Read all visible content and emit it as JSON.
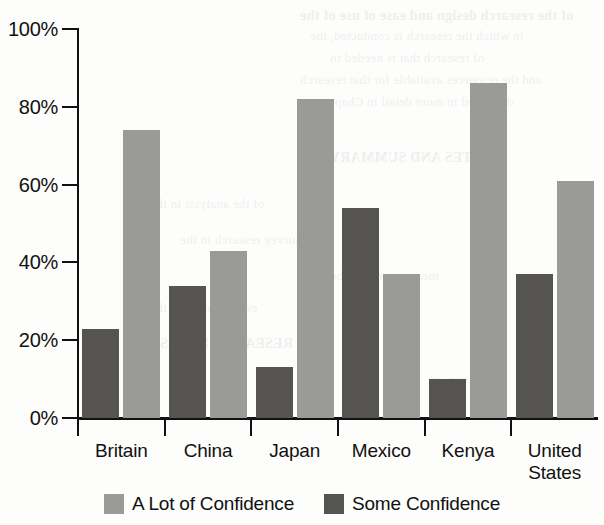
{
  "chart_data": {
    "type": "bar",
    "title": "",
    "xlabel": "",
    "ylabel": "",
    "ylim": [
      0,
      100
    ],
    "ytick_labels": [
      "0%",
      "20%",
      "40%",
      "60%",
      "80%",
      "100%"
    ],
    "ytick_values": [
      0,
      20,
      40,
      60,
      80,
      100
    ],
    "grid": false,
    "legend_position": "bottom-center",
    "categories": [
      "Britain",
      "China",
      "Japan",
      "Mexico",
      "Kenya",
      "United States"
    ],
    "category_label_lines": [
      [
        "Britain"
      ],
      [
        "China"
      ],
      [
        "Japan"
      ],
      [
        "Mexico"
      ],
      [
        "Kenya"
      ],
      [
        "United",
        "States"
      ]
    ],
    "series": [
      {
        "name": "Some Confidence",
        "color": "#555452",
        "draw_order": 1,
        "values": [
          23,
          34,
          13,
          54,
          10,
          37
        ]
      },
      {
        "name": "A Lot of Confidence",
        "color": "#9a9a98",
        "draw_order": 2,
        "values": [
          74,
          43,
          82,
          37,
          86,
          61
        ]
      }
    ],
    "legend": [
      {
        "label": "A Lot of Confidence",
        "color": "#9a9a98",
        "swatch": "alot"
      },
      {
        "label": "Some Confidence",
        "color": "#555452",
        "swatch": "some"
      }
    ]
  },
  "ghost_text": {
    "lines": [
      "of the research design and ease of use of the",
      "in which the research is conducted, the",
      "of research that is needed to",
      "and the resources available for that research",
      "discussed in more detail in Chapter",
      "NOTES AND SUMMARY",
      "of the analysis in the",
      "survey research in the",
      "measurements to be",
      "evaluation from the",
      "RESEARCH NOTES",
      "a given set"
    ]
  }
}
